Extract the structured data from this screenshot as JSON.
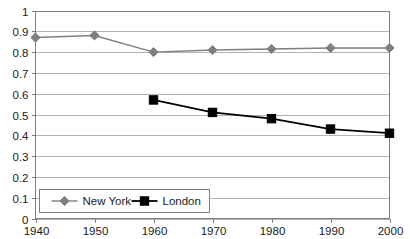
{
  "chart_data": {
    "type": "line",
    "title": "",
    "subtitle": "",
    "xlabel": "",
    "ylabel": "",
    "x": [
      1940,
      1950,
      1960,
      1970,
      1980,
      1990,
      2000
    ],
    "xlim": [
      1940,
      2000
    ],
    "ylim": [
      0,
      1
    ],
    "x_tick_labels": [
      "1940",
      "1950",
      "1960",
      "1970",
      "1980",
      "1990",
      "2000"
    ],
    "y_tick_labels": [
      "0",
      "0.1",
      "0.2",
      "0.3",
      "0.4",
      "0.5",
      "0.6",
      "0.7",
      "0.8",
      "0.9",
      "1"
    ],
    "y_ticks": [
      0,
      0.1,
      0.2,
      0.3,
      0.4,
      0.5,
      0.6,
      0.7,
      0.8,
      0.9,
      1
    ],
    "grid": true,
    "grid_axis": "y",
    "legend_position": "inside-bottom-left",
    "series": [
      {
        "name": "New York",
        "marker": "diamond",
        "color": "#7f7f7f",
        "x": [
          1940,
          1950,
          1960,
          1970,
          1980,
          1990,
          2000
        ],
        "values": [
          0.87,
          0.88,
          0.8,
          0.81,
          0.815,
          0.82,
          0.82
        ]
      },
      {
        "name": "London",
        "marker": "square",
        "color": "#000000",
        "x": [
          1960,
          1970,
          1980,
          1990,
          2000
        ],
        "values": [
          0.57,
          0.51,
          0.48,
          0.43,
          0.41
        ]
      }
    ]
  },
  "legend": {
    "entries": [
      {
        "label": "New York"
      },
      {
        "label": "London"
      }
    ]
  },
  "style": {
    "background": "#ffffff",
    "grid_color": "#b3b3b3",
    "axis_color": "#808080",
    "text_color": "#1a1a1a",
    "legend_border": "#808080",
    "series_new_york": "#7f7f7f",
    "series_london": "#000000"
  }
}
